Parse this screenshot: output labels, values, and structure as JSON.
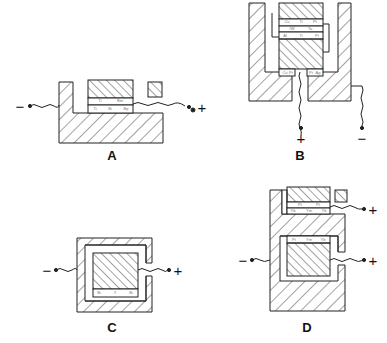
{
  "figures": {
    "A": {
      "label": "A",
      "neg": "−",
      "pos": "+",
      "annotations": [
        "Ti",
        "Bm",
        "Ti",
        "Bi",
        "Bp"
      ]
    },
    "B": {
      "label": "B",
      "neg": "−",
      "pos": "+",
      "annotations": [
        "Cu",
        "Ti",
        "Pt",
        "IW",
        "Ta",
        "Al",
        "Ti",
        "Pt",
        "Cu",
        "Pt",
        "Pt",
        "Ag"
      ]
    },
    "C": {
      "label": "C",
      "neg": "−",
      "pos": "+",
      "annotations": [
        "Bi",
        "Y",
        "Bi"
      ]
    },
    "D": {
      "label": "D",
      "neg": "−",
      "pos_top": "+",
      "pos_mid": "+",
      "annotations": [
        "Pt",
        "Pt",
        "Yb",
        "Ym",
        "Yb",
        "Pt",
        "Ym",
        "Yb"
      ]
    }
  },
  "colors": {
    "stroke": "#222222",
    "background": "#ffffff"
  }
}
